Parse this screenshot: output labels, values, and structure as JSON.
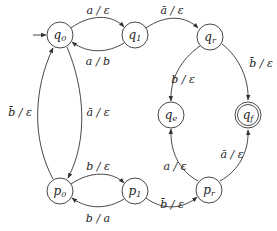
{
  "diagram": {
    "type": "state-machine",
    "initial_state": "q0",
    "accepting_states": [
      "qf"
    ],
    "states": [
      {
        "id": "q0",
        "base": "q",
        "sub": "0",
        "x": 60,
        "y": 35
      },
      {
        "id": "q1",
        "base": "q",
        "sub": "1",
        "x": 135,
        "y": 35
      },
      {
        "id": "qr",
        "base": "q",
        "sub": "r",
        "x": 210,
        "y": 37
      },
      {
        "id": "qe",
        "base": "q",
        "sub": "e",
        "x": 171,
        "y": 115
      },
      {
        "id": "qf",
        "base": "q",
        "sub": "f",
        "x": 248,
        "y": 115
      },
      {
        "id": "p0",
        "base": "p",
        "sub": "0",
        "x": 60,
        "y": 191
      },
      {
        "id": "p1",
        "base": "p",
        "sub": "1",
        "x": 135,
        "y": 191
      },
      {
        "id": "pr",
        "base": "p",
        "sub": "r",
        "x": 209,
        "y": 190
      }
    ],
    "edges": [
      {
        "from": "q0",
        "to": "q1",
        "label": "a / ε"
      },
      {
        "from": "q1",
        "to": "q0",
        "label": "a / b"
      },
      {
        "from": "q1",
        "to": "qr",
        "label": "ā / ε"
      },
      {
        "from": "qr",
        "to": "qe",
        "label": "b / ε"
      },
      {
        "from": "qr",
        "to": "qf",
        "label": "b̄ / ε"
      },
      {
        "from": "q0",
        "to": "p0",
        "label": "ā / ε"
      },
      {
        "from": "p0",
        "to": "q0",
        "label": "b̄ / ε"
      },
      {
        "from": "p0",
        "to": "p1",
        "label": "b / ε"
      },
      {
        "from": "p1",
        "to": "p0",
        "label": "b / a"
      },
      {
        "from": "p1",
        "to": "pr",
        "label": "b̄ / ε"
      },
      {
        "from": "pr",
        "to": "qe",
        "label": "a / ε"
      },
      {
        "from": "pr",
        "to": "qf",
        "label": "ā / ε"
      }
    ]
  },
  "labels": {
    "q0": {
      "base": "q",
      "sub": "0"
    },
    "q1": {
      "base": "q",
      "sub": "1"
    },
    "qr": {
      "base": "q",
      "sub": "r"
    },
    "qe": {
      "base": "q",
      "sub": "e"
    },
    "qf": {
      "base": "q",
      "sub": "f"
    },
    "p0": {
      "base": "p",
      "sub": "0"
    },
    "p1": {
      "base": "p",
      "sub": "1"
    },
    "pr": {
      "base": "p",
      "sub": "r"
    },
    "e_q0_q1": "a / ε",
    "e_q1_q0": "a / b",
    "e_q1_qr": "ā / ε",
    "e_qr_qe": "b / ε",
    "e_qr_qf": "b̄ / ε",
    "e_q0_p0": "ā / ε",
    "e_p0_q0": "b̄ / ε",
    "e_p0_p1": "b / ε",
    "e_p1_p0": "b / a",
    "e_p1_pr": "b̄ / ε",
    "e_pr_qe": "a / ε",
    "e_pr_qf": "ā / ε"
  }
}
